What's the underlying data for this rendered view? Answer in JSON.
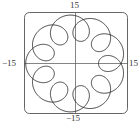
{
  "chart_data": {
    "type": "line",
    "title": "",
    "xlabel": "",
    "ylabel": "",
    "xlim": [
      -15,
      15
    ],
    "ylim": [
      -15,
      15
    ],
    "grid": false,
    "legend": null,
    "tick_labels": {
      "top": "15",
      "bottom": "−15",
      "left": "−15",
      "right": "15"
    },
    "curve": {
      "kind": "parametric",
      "description": "closed looping curve with 9 inward loops around a circle of radius ~15",
      "x_of_t": "A*cos(t) - B*cos(k*t)",
      "y_of_t": "A*sin(t) - B*sin(k*t)",
      "A": 10.6,
      "B": 3.9,
      "k": 10,
      "t_range": [
        0,
        6.2832
      ],
      "loops": 9,
      "color": "#2a2a2a"
    },
    "frame": {
      "rounded": true,
      "color": "#555555"
    },
    "axes_color": "#666666"
  }
}
